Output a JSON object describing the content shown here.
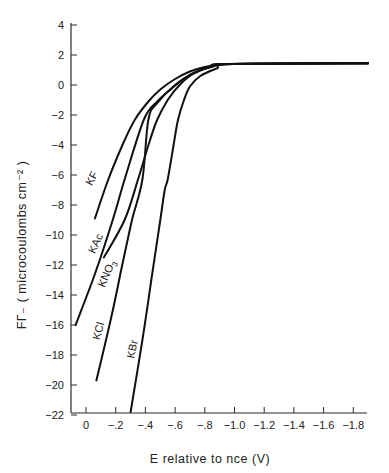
{
  "chart_data": {
    "type": "line",
    "title": "",
    "xlabel": "E relative to nce (V)",
    "ylabel": "FΓ₋ ( microcoulombs cm⁻² )",
    "xlim": [
      0.07,
      -1.9
    ],
    "ylim": [
      -22,
      4
    ],
    "x_reversed": true,
    "grid": false,
    "legend": "inline labels",
    "x_ticks": [
      0,
      -0.2,
      -0.4,
      -0.6,
      -0.8,
      -1.0,
      -1.2,
      -1.4,
      -1.6,
      -1.8
    ],
    "x_tick_labels": [
      "0",
      "-0.2",
      "-0.4",
      "-0.6",
      "-0.8",
      "-1.0",
      "-1.2",
      "-1.4",
      "-1.6",
      "-1.8"
    ],
    "y_ticks": [
      4,
      2,
      0,
      -2,
      -4,
      -6,
      -8,
      -10,
      -12,
      -14,
      -16,
      -18,
      -20,
      -22
    ],
    "y_tick_labels": [
      "4",
      "2",
      "0",
      "-2",
      "-4",
      "-6",
      "-8",
      "-10",
      "-12",
      "-14",
      "-16",
      "-18",
      "-20",
      "-22"
    ],
    "series": [
      {
        "name": "KF",
        "x": [
          -0.06,
          -0.15,
          -0.25,
          -0.33,
          -0.42,
          -0.5,
          -0.6,
          -0.7,
          -0.8,
          -0.9,
          -1.0,
          -1.9
        ],
        "y": [
          -8.9,
          -6.3,
          -3.9,
          -2.3,
          -1.1,
          -0.3,
          0.4,
          0.9,
          1.2,
          1.35,
          1.4,
          1.45
        ],
        "label_pos": [
          95,
          180
        ],
        "label_angle": -62
      },
      {
        "name": "KAc",
        "x": [
          0.07,
          -0.06,
          -0.18,
          -0.26,
          -0.39,
          -0.48,
          -0.57,
          -0.67,
          -0.77,
          -0.86,
          -0.95,
          -1.9
        ],
        "y": [
          -16.0,
          -12.6,
          -9.0,
          -6.3,
          -2.3,
          -1.1,
          -0.3,
          0.5,
          1.0,
          1.25,
          1.4,
          1.45
        ],
        "label_pos": [
          99,
          245
        ],
        "label_angle": -65
      },
      {
        "name": "KNO3",
        "x": [
          -0.12,
          -0.26,
          -0.35,
          -0.43,
          -0.48,
          -0.55,
          -0.63,
          -0.73,
          -0.84,
          -0.95,
          -1.9
        ],
        "y": [
          -11.5,
          -9.0,
          -6.3,
          -3.7,
          -2.3,
          -1.0,
          0.0,
          0.8,
          1.2,
          1.4,
          1.45
        ],
        "label_pos": [
          110,
          275
        ],
        "label_angle": -67
      },
      {
        "name": "KCl",
        "x": [
          -0.07,
          -0.17,
          -0.24,
          -0.31,
          -0.38,
          -0.42,
          -0.48,
          -0.6,
          -0.73,
          -0.87,
          -0.97,
          -1.9
        ],
        "y": [
          -19.7,
          -15.5,
          -12.2,
          -9.0,
          -6.3,
          -2.3,
          -1.2,
          0.0,
          0.8,
          1.3,
          1.4,
          1.45
        ],
        "label_pos": [
          102,
          332
        ],
        "label_angle": -75
      },
      {
        "name": "KBr",
        "x": [
          -0.3,
          -0.38,
          -0.44,
          -0.5,
          -0.53,
          -0.55,
          -0.59,
          -0.62,
          -0.66,
          -0.7,
          -0.77,
          -0.88,
          -0.99,
          -1.9
        ],
        "y": [
          -21.8,
          -17.0,
          -13.0,
          -9.0,
          -7.0,
          -6.3,
          -4.0,
          -2.3,
          -1.0,
          -0.1,
          0.6,
          1.1,
          1.4,
          1.45
        ],
        "label_pos": [
          136,
          350
        ],
        "label_angle": -78
      }
    ]
  },
  "labels": {
    "ylabel": "FΓ₋ ( microcoulombs cm⁻² )",
    "xlabel": "E relative to nce (V)"
  }
}
